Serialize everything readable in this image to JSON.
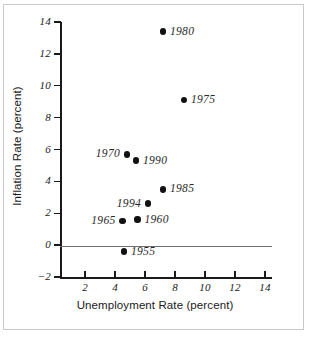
{
  "chart_data": {
    "type": "scatter",
    "title": "",
    "xlabel": "Unemployment Rate (percent)",
    "ylabel": "Inflation Rate (percent)",
    "xlim": [
      0,
      14.8
    ],
    "ylim": [
      -2,
      14
    ],
    "xticks": [
      2,
      4,
      6,
      8,
      10,
      12,
      14
    ],
    "yticks": [
      -2,
      0,
      2,
      4,
      6,
      8,
      10,
      12,
      14
    ],
    "xtick_labels": [
      "2",
      "4",
      "6",
      "8",
      "10",
      "12",
      "14"
    ],
    "ytick_labels": [
      "−2",
      "0",
      "2",
      "4",
      "6",
      "8",
      "10",
      "12",
      "14"
    ],
    "grid": false,
    "legend": "none",
    "reference_lines": [
      {
        "name": "zero-inflation-line",
        "axis": "y",
        "value": 0
      }
    ],
    "marker": {
      "shape": "circle",
      "color": "#111111",
      "size": 6.5
    },
    "points": [
      {
        "label": "1980",
        "x": 7.2,
        "y": 13.4,
        "label_side": "right"
      },
      {
        "label": "1975",
        "x": 8.6,
        "y": 9.1,
        "label_side": "right"
      },
      {
        "label": "1970",
        "x": 4.8,
        "y": 5.7,
        "label_side": "left"
      },
      {
        "label": "1990",
        "x": 5.4,
        "y": 5.3,
        "label_side": "right"
      },
      {
        "label": "1985",
        "x": 7.2,
        "y": 3.5,
        "label_side": "right"
      },
      {
        "label": "1994",
        "x": 6.2,
        "y": 2.6,
        "label_side": "left"
      },
      {
        "label": "1960",
        "x": 5.5,
        "y": 1.6,
        "label_side": "right"
      },
      {
        "label": "1965",
        "x": 4.5,
        "y": 1.5,
        "label_side": "left"
      },
      {
        "label": "1955",
        "x": 4.6,
        "y": -0.4,
        "label_side": "right"
      }
    ]
  }
}
